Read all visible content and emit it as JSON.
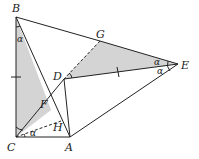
{
  "diagram": {
    "type": "geometry",
    "points": {
      "A": {
        "label": "A",
        "x": 70,
        "y": 137
      },
      "B": {
        "label": "B",
        "x": 16,
        "y": 17
      },
      "C": {
        "label": "C",
        "x": 16,
        "y": 137
      },
      "D": {
        "label": "D",
        "x": 64,
        "y": 79
      },
      "E": {
        "label": "E",
        "x": 178,
        "y": 64
      },
      "F": {
        "label": "F",
        "x": 51,
        "y": 110
      },
      "G": {
        "label": "G",
        "x": 100,
        "y": 41
      },
      "H": {
        "label": "H",
        "x": 61,
        "y": 121
      }
    },
    "angle_labels": [
      "α",
      "α",
      "α",
      "α"
    ],
    "colors": {
      "line": "#222222",
      "shade": "#d4d4d4"
    }
  }
}
